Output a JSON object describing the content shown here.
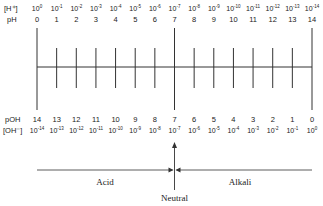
{
  "diagram": {
    "top_rows": {
      "h_label": "[H⁺]",
      "ph_label": "pH",
      "h_exponents": [
        "0",
        "-1",
        "-2",
        "-3",
        "-4",
        "-5",
        "-6",
        "-7",
        "-8",
        "-9",
        "-10",
        "-11",
        "-12",
        "-13",
        "-14"
      ],
      "ph_values": [
        "0",
        "1",
        "2",
        "3",
        "4",
        "5",
        "6",
        "7",
        "8",
        "9",
        "10",
        "11",
        "12",
        "13",
        "14"
      ]
    },
    "bottom_rows": {
      "poh_label": "pOH",
      "oh_label": "[OH⁻]",
      "poh_values": [
        "14",
        "13",
        "12",
        "11",
        "10",
        "9",
        "8",
        "7",
        "6",
        "5",
        "4",
        "3",
        "2",
        "1",
        "0"
      ],
      "oh_exponents": [
        "-14",
        "-13",
        "-12",
        "-11",
        "-10",
        "-9",
        "-8",
        "-7",
        "-6",
        "-5",
        "-4",
        "-3",
        "-2",
        "-1",
        "0"
      ]
    },
    "base": "10",
    "regions": {
      "acid": "Acid",
      "alkali": "Alkali",
      "neutral": "Neutral"
    },
    "colors": {
      "line": "#333333",
      "text": "#222222"
    }
  }
}
